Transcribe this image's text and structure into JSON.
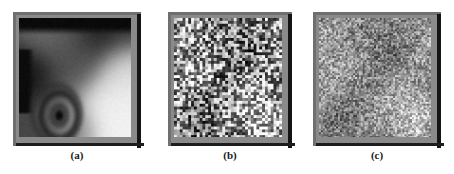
{
  "figure": {
    "background_color": "#ffffff",
    "panel_count": 3,
    "frame_color": "#6f6f6f",
    "shadow_color": "#141414"
  },
  "panels": [
    {
      "id": "a",
      "caption": "(a)",
      "kind": "grayscale-photograph",
      "description": "blurred low-resolution grayscale image",
      "background_gray": "#3a3a3a",
      "noise": "none"
    },
    {
      "id": "b",
      "caption": "(b)",
      "kind": "noise-disc",
      "description": "circular region of coarse high-contrast block noise on flat gray field",
      "background_gray": "#8a8a8a",
      "noise": "coarse-high-contrast",
      "disc_radius_fraction": 0.47,
      "block_size_px": 3,
      "noise_amplitude": 115
    },
    {
      "id": "c",
      "caption": "(c)",
      "kind": "noise-disc",
      "description": "circular region of fine low-contrast block noise on flat gray field",
      "background_gray": "#8d8d8d",
      "noise": "fine-low-contrast",
      "disc_radius_fraction": 0.46,
      "block_size_px": 2,
      "noise_amplitude": 70
    }
  ],
  "chart_data": {
    "type": "heatmap",
    "title": "",
    "xlabel": "",
    "ylabel": "",
    "panels": [
      {
        "label": "(a)",
        "type": "image",
        "content": "blurred grayscale photograph",
        "value_range": [
          0,
          255
        ],
        "regions": [
          {
            "name": "top-dark-band",
            "tone": 18
          },
          {
            "name": "upper-left-midgray",
            "tone": 125
          },
          {
            "name": "left-black-block",
            "tone": 14
          },
          {
            "name": "upper-right-dark",
            "tone": 40
          },
          {
            "name": "lower-right-white",
            "tone": 246
          },
          {
            "name": "bottom-ring-shape",
            "tone": 70
          }
        ]
      },
      {
        "label": "(b)",
        "type": "noise-disc",
        "base_tone": 138,
        "noise_amplitude": 115,
        "block_size": 3,
        "disc_radius_fraction": 0.47
      },
      {
        "label": "(c)",
        "type": "noise-disc",
        "base_tone": 141,
        "noise_amplitude": 70,
        "block_size": 2,
        "disc_radius_fraction": 0.46
      }
    ]
  }
}
